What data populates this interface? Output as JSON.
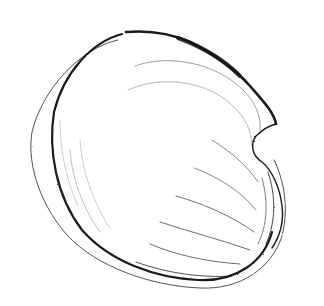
{
  "image": {
    "subject": "bivalve shell illustration",
    "style": "monochrome pen-and-ink engraving",
    "background_color": "#ffffff",
    "ink_color": "#1a1a1a"
  }
}
